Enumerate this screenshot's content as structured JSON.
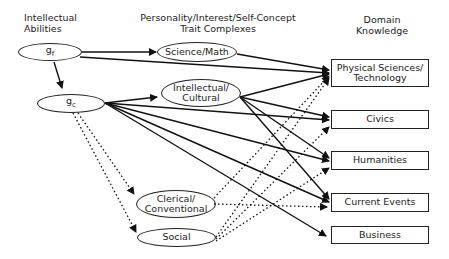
{
  "headers": {
    "abilities": "Intellectual\nAbilities",
    "traits": "Personality/Interest/Self-Concept\nTrait Complexes",
    "domain": "Domain\nKnowledge"
  },
  "abilities": [
    {
      "id": "gf",
      "label": "gf"
    },
    {
      "id": "gc",
      "label": "gc"
    }
  ],
  "traits": [
    {
      "id": "sci",
      "label": "Science/Math"
    },
    {
      "id": "intel",
      "label": "Intellectual/\nCultural"
    },
    {
      "id": "cler",
      "label": "Clerical/\nConventional"
    },
    {
      "id": "soc",
      "label": "Social"
    }
  ],
  "domains": [
    {
      "id": "phys",
      "label": "Physical Sciences/\nTechnology"
    },
    {
      "id": "civ",
      "label": "Civics"
    },
    {
      "id": "hum",
      "label": "Humanities"
    },
    {
      "id": "cur",
      "label": "Current Events"
    },
    {
      "id": "bus",
      "label": "Business"
    }
  ],
  "edges_solid": [
    [
      "gf",
      "sci"
    ],
    [
      "gf",
      "phys"
    ],
    [
      "gf",
      "gc"
    ],
    [
      "sci",
      "phys"
    ],
    [
      "gc",
      "intel"
    ],
    [
      "gc",
      "civ"
    ],
    [
      "gc",
      "hum"
    ],
    [
      "gc",
      "cur"
    ],
    [
      "gc",
      "bus"
    ],
    [
      "intel",
      "phys"
    ],
    [
      "intel",
      "civ"
    ],
    [
      "intel",
      "hum"
    ],
    [
      "intel",
      "cur"
    ]
  ],
  "edges_dotted": [
    [
      "gc",
      "cler"
    ],
    [
      "gc",
      "soc"
    ],
    [
      "cler",
      "phys"
    ],
    [
      "cler",
      "cur"
    ],
    [
      "soc",
      "phys"
    ],
    [
      "soc",
      "civ"
    ],
    [
      "soc",
      "hum"
    ]
  ]
}
